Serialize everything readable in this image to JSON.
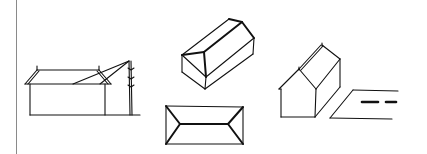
{
  "figure": {
    "colors": {
      "ink": "#111111",
      "divider": "#8a8a8a",
      "background": "#ffffff"
    },
    "sketches": [
      {
        "id": "house-elevation-with-pole",
        "label": ""
      },
      {
        "id": "hip-roof-house-isometric",
        "label": ""
      },
      {
        "id": "hip-roof-plan-view",
        "label": ""
      },
      {
        "id": "gable-house-isometric-with-road",
        "label": ""
      }
    ]
  }
}
